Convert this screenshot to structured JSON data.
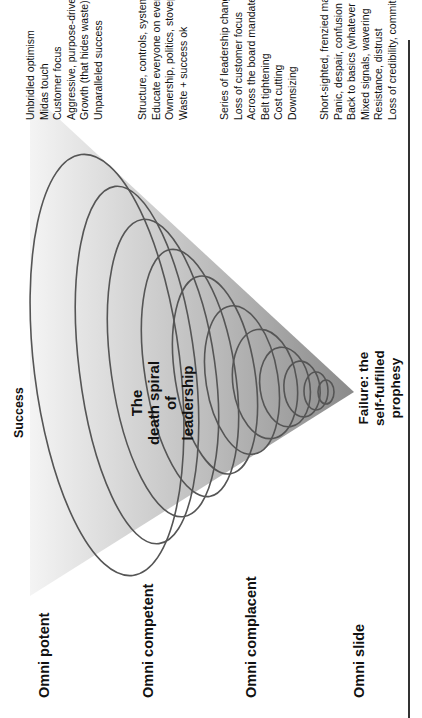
{
  "figure": {
    "top_label": "Success",
    "center_title": [
      "The",
      "death spiral",
      "of",
      "leadership"
    ],
    "bottom_label": [
      "Failure: the",
      "self-fulfilled",
      "prophesy"
    ],
    "phases": [
      {
        "label": "Omni potent",
        "items": [
          "Unbridled optimism",
          "Midas touch",
          "Customer focus",
          "Aggressive, purpose-driven leadership",
          "Growth (that hides waste)",
          "Unparalleled success"
        ]
      },
      {
        "label": "Omni competent",
        "items": [
          "Structure, controls, systems",
          "Educate everyone on everything",
          "Ownership, politics, stovepipes",
          "Waste + success ok"
        ]
      },
      {
        "label": "Omni complacent",
        "items": [
          "Series of leadership changes",
          "Loss of customer focus",
          "Across the board mandates",
          "Belt tightening",
          "Cost cutting",
          "Downsizing"
        ]
      },
      {
        "label": "Omni slide",
        "items": [
          "Short-sighted, frenzied management",
          "Panic, despair, confusion",
          "Back to basics (whatever that was!)",
          "Mixed signals, wavering",
          "Resistance, distrust",
          "Loss of credibility, commitment"
        ]
      }
    ],
    "colors": {
      "triangle_top": "#f2f2f2",
      "triangle_bottom": "#8c8c8c",
      "spiral_stroke": "#555555",
      "text": "#111111"
    }
  }
}
